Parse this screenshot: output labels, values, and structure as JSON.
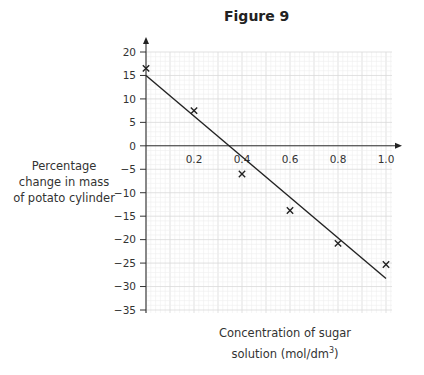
{
  "figure_title": "Figure 9",
  "chart_data": {
    "type": "scatter",
    "title": "Figure 9",
    "xlabel": "Concentration of sugar solution (mol/dm³)",
    "xlabel_line1": "Concentration of sugar",
    "xlabel_line2": "solution (mol/dm",
    "xlabel_unit_sup": "3",
    "xlabel_close": ")",
    "ylabel": "Percentage change in mass of potato cylinder",
    "ylabel_lines": [
      "Percentage",
      "change in mass",
      "of potato cylinder"
    ],
    "xlim": [
      0,
      1.0
    ],
    "ylim": [
      -35,
      20
    ],
    "x_ticks": [
      0.2,
      0.4,
      0.6,
      0.8,
      1.0
    ],
    "x_tick_labels": [
      "0.2",
      "0.4",
      "0.6",
      "0.8",
      "1.0"
    ],
    "y_ticks": [
      20,
      15,
      10,
      5,
      0,
      -5,
      -10,
      -15,
      -20,
      -25,
      -30,
      -35
    ],
    "y_tick_labels": [
      "20",
      "15",
      "10",
      "5",
      "0",
      "−5",
      "−10",
      "−15",
      "−20",
      "−25",
      "−30",
      "−35"
    ],
    "grid": true,
    "series": [
      {
        "name": "Measured values",
        "marker": "x",
        "x": [
          0.0,
          0.2,
          0.4,
          0.6,
          0.8,
          1.0
        ],
        "y": [
          16.5,
          7.5,
          -6.0,
          -13.8,
          -20.8,
          -25.3
        ]
      },
      {
        "name": "Line of best fit",
        "type": "line",
        "x": [
          0.0,
          1.0
        ],
        "y": [
          15.0,
          -28.3
        ]
      }
    ]
  }
}
